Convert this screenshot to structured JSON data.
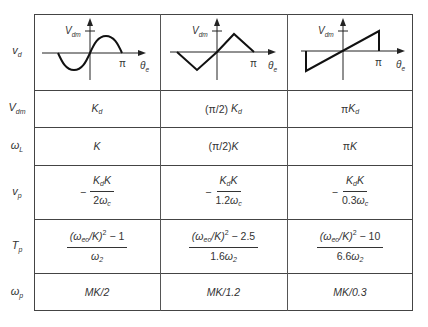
{
  "table": {
    "row_labels": [
      {
        "main": "v",
        "sub": "d"
      },
      {
        "main": "V",
        "sub": "dm"
      },
      {
        "main": "ω",
        "sub": "L"
      },
      {
        "main": "v",
        "sub": "p"
      },
      {
        "main": "T",
        "sub": "p"
      },
      {
        "main": "ω",
        "sub": "p"
      }
    ],
    "graphs": [
      {
        "type": "sinusoidal",
        "y_label_main": "V",
        "y_label_sub": "dm",
        "x_tick": "π",
        "x_label_main": "θ",
        "x_label_sub": "e"
      },
      {
        "type": "triangular",
        "y_label_main": "V",
        "y_label_sub": "dm",
        "x_tick": "π",
        "x_label_main": "θ",
        "x_label_sub": "e"
      },
      {
        "type": "sawtooth",
        "y_label_main": "V",
        "y_label_sub": "dm",
        "x_tick": "π",
        "x_label_main": "θ",
        "x_label_sub": "e"
      }
    ],
    "vdm": [
      {
        "prefix": "",
        "main": "K",
        "sub": "d"
      },
      {
        "prefix": "(π/2) ",
        "main": "K",
        "sub": "d"
      },
      {
        "prefix": "π",
        "main": "K",
        "sub": "d"
      }
    ],
    "omega_L": [
      {
        "prefix": "",
        "main": "K"
      },
      {
        "prefix": "(π/2)",
        "main": "K"
      },
      {
        "prefix": "π",
        "main": "K"
      }
    ],
    "vp": [
      {
        "sign": "−",
        "num_a": "K",
        "num_a_sub": "d",
        "num_b": "K",
        "den_coef": "2",
        "den_var": "ω",
        "den_sub": "c"
      },
      {
        "sign": "−",
        "num_a": "K",
        "num_a_sub": "d",
        "num_b": "K",
        "den_coef": "1.2",
        "den_var": "ω",
        "den_sub": "c"
      },
      {
        "sign": "−",
        "num_a": "K",
        "num_a_sub": "d",
        "num_b": "K",
        "den_coef": "0.3",
        "den_var": "ω",
        "den_sub": "c"
      }
    ],
    "Tp": [
      {
        "num_open": "(ω",
        "num_sub": "eo",
        "num_mid": "/K)",
        "num_exp": "2",
        "num_tail": " − 1",
        "den_coef": "",
        "den_var": "ω",
        "den_sub": "2"
      },
      {
        "num_open": "(ω",
        "num_sub": "eo",
        "num_mid": "/K)",
        "num_exp": "2",
        "num_tail": " − 2.5",
        "den_coef": "1.6",
        "den_var": "ω",
        "den_sub": "2"
      },
      {
        "num_open": "(ω",
        "num_sub": "eo",
        "num_mid": "/K)",
        "num_exp": "2",
        "num_tail": " − 10",
        "den_coef": "6.6",
        "den_var": "ω",
        "den_sub": "2"
      }
    ],
    "omega_p": [
      "MK/2",
      "MK/1.2",
      "MK/0.3"
    ]
  }
}
